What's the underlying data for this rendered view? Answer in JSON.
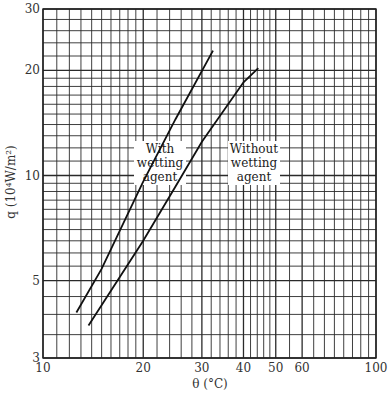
{
  "chart_data": {
    "type": "line",
    "title": "",
    "xlabel": "θ (°C)",
    "ylabel": "q  (10⁴W/m²)",
    "xscale": "log",
    "yscale": "log",
    "xlim": [
      10,
      100
    ],
    "ylim": [
      3,
      30
    ],
    "grid": true,
    "x_tick_labels": [
      "10",
      "20",
      "30",
      "40",
      "50",
      "60",
      "100"
    ],
    "x_ticks": [
      10,
      20,
      30,
      40,
      50,
      60,
      100
    ],
    "y_tick_labels": [
      "3",
      "5",
      "10",
      "20",
      "30"
    ],
    "y_ticks": [
      3,
      5,
      10,
      20,
      30
    ],
    "x_grid": [
      10,
      11,
      12,
      13,
      14,
      15,
      16,
      17,
      18,
      19,
      20,
      22,
      24,
      26,
      28,
      30,
      32,
      34,
      36,
      38,
      40,
      42,
      44,
      46,
      48,
      50,
      55,
      60,
      65,
      70,
      75,
      80,
      85,
      90,
      95,
      100
    ],
    "y_grid": [
      3,
      3.5,
      4,
      4.5,
      5,
      5.5,
      6,
      6.5,
      7,
      7.5,
      8,
      8.5,
      9,
      9.5,
      10,
      11,
      12,
      13,
      14,
      15,
      16,
      17,
      18,
      19,
      20,
      22,
      24,
      26,
      28,
      30
    ],
    "series": [
      {
        "name": "With wetting agent",
        "x": [
          12.6,
          15,
          20,
          25,
          32.4
        ],
        "y": [
          4.05,
          5.4,
          9.6,
          14.5,
          22.8
        ]
      },
      {
        "name": "Without wetting agent",
        "x": [
          13.7,
          20,
          25,
          30,
          40,
          44.3
        ],
        "y": [
          3.72,
          6.5,
          9.3,
          12.5,
          18.5,
          20.3
        ]
      }
    ],
    "annotations": [
      {
        "text": [
          "With",
          "wetting",
          "agent"
        ],
        "target": "With wetting agent"
      },
      {
        "text": [
          "Without",
          "wetting",
          "agent"
        ],
        "target": "Without wetting agent"
      }
    ]
  }
}
